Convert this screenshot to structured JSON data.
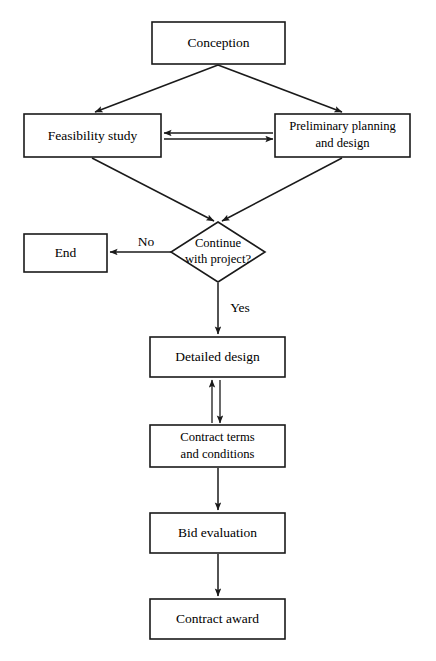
{
  "diagram": {
    "background_color": "#ffffff",
    "line_color": "#1a1a1a",
    "text_color": "#000000",
    "nodes": [
      {
        "id": "conception",
        "shape": "rectangle",
        "label": "Conception",
        "lines": [
          "Conception"
        ],
        "x": 152,
        "y": 22,
        "w": 133,
        "h": 42
      },
      {
        "id": "feasibility-study",
        "shape": "rectangle",
        "label": "Feasibility study",
        "lines": [
          "Feasibility study"
        ],
        "x": 24,
        "y": 114,
        "w": 137,
        "h": 43
      },
      {
        "id": "preliminary-planning-and-design",
        "shape": "rectangle",
        "label": "Preliminary planning and design",
        "lines": [
          "Preliminary planning",
          "and design"
        ],
        "x": 275,
        "y": 114,
        "w": 135,
        "h": 43
      },
      {
        "id": "continue-with-project",
        "shape": "diamond",
        "label": "Continue with project?",
        "lines": [
          "Continue",
          "with project?"
        ],
        "cx": 218,
        "cy": 252,
        "rx": 47,
        "ry": 30
      },
      {
        "id": "end",
        "shape": "rectangle",
        "label": "End",
        "lines": [
          "End"
        ],
        "x": 24,
        "y": 234,
        "w": 83,
        "h": 38
      },
      {
        "id": "detailed-design",
        "shape": "rectangle",
        "label": "Detailed design",
        "lines": [
          "Detailed design"
        ],
        "x": 150,
        "y": 337,
        "w": 135,
        "h": 40
      },
      {
        "id": "contract-terms-and-conditions",
        "shape": "rectangle",
        "label": "Contract terms and conditions",
        "lines": [
          "Contract terms",
          "and conditions"
        ],
        "x": 150,
        "y": 425,
        "w": 135,
        "h": 42
      },
      {
        "id": "bid-evaluation",
        "shape": "rectangle",
        "label": "Bid evaluation",
        "lines": [
          "Bid evaluation"
        ],
        "x": 150,
        "y": 513,
        "w": 135,
        "h": 40
      },
      {
        "id": "contract-award",
        "shape": "rectangle",
        "label": "Contract award",
        "lines": [
          "Contract award"
        ],
        "x": 150,
        "y": 599,
        "w": 135,
        "h": 40
      }
    ],
    "edges": [
      {
        "id": "conception-to-feasibility",
        "from": "conception",
        "to": "feasibility-study",
        "style": "single-arrow",
        "label": ""
      },
      {
        "id": "conception-to-preliminary",
        "from": "conception",
        "to": "preliminary-planning-and-design",
        "style": "single-arrow",
        "label": ""
      },
      {
        "id": "feasibility-to-preliminary",
        "from": "feasibility-study",
        "to": "preliminary-planning-and-design",
        "style": "double-arrow-horizontal",
        "label": ""
      },
      {
        "id": "feasibility-to-decision",
        "from": "feasibility-study",
        "to": "continue-with-project",
        "style": "single-arrow",
        "label": ""
      },
      {
        "id": "preliminary-to-decision",
        "from": "preliminary-planning-and-design",
        "to": "continue-with-project",
        "style": "single-arrow",
        "label": ""
      },
      {
        "id": "decision-to-end",
        "from": "continue-with-project",
        "to": "end",
        "style": "single-arrow",
        "label": "No"
      },
      {
        "id": "decision-to-detailed-design",
        "from": "continue-with-project",
        "to": "detailed-design",
        "style": "single-arrow",
        "label": "Yes"
      },
      {
        "id": "detailed-design-to-contract-terms",
        "from": "detailed-design",
        "to": "contract-terms-and-conditions",
        "style": "double-arrow-vertical",
        "label": ""
      },
      {
        "id": "contract-terms-to-bid-evaluation",
        "from": "contract-terms-and-conditions",
        "to": "bid-evaluation",
        "style": "single-arrow",
        "label": ""
      },
      {
        "id": "bid-evaluation-to-contract-award",
        "from": "bid-evaluation",
        "to": "contract-award",
        "style": "single-arrow",
        "label": ""
      }
    ],
    "edge_labels": {
      "no": "No",
      "yes": "Yes"
    }
  }
}
